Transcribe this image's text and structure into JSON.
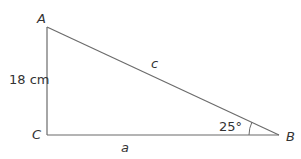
{
  "diagram": {
    "type": "right-triangle",
    "vertices": {
      "A": {
        "label": "A"
      },
      "B": {
        "label": "B"
      },
      "C": {
        "label": "C"
      }
    },
    "sides": {
      "AC": {
        "label": "18 cm"
      },
      "AB": {
        "label": "c"
      },
      "CB": {
        "label": "a"
      }
    },
    "angles": {
      "B": {
        "label": "25°"
      }
    },
    "colors": {
      "stroke": "#6b6b6b",
      "text": "#333333"
    }
  }
}
